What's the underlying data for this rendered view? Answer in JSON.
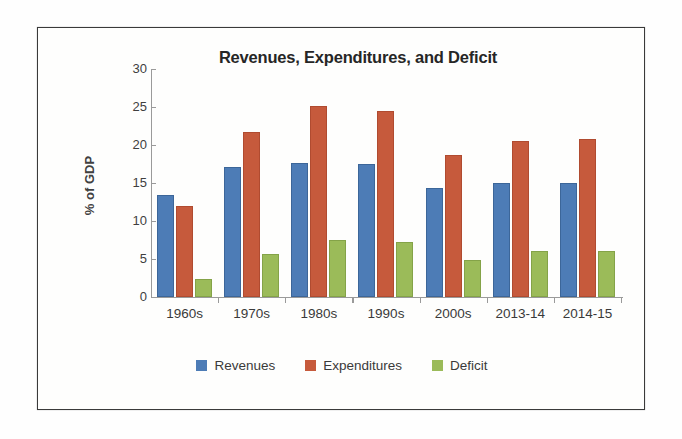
{
  "chart_data": {
    "type": "bar",
    "title": "Revenues, Expenditures, and Deficit",
    "xlabel": "",
    "ylabel": "% of GDP",
    "ylim": [
      0,
      30
    ],
    "yticks": [
      0,
      5,
      10,
      15,
      20,
      25,
      30
    ],
    "grid": false,
    "legend_position": "bottom",
    "categories": [
      "1960s",
      "1970s",
      "1980s",
      "1990s",
      "2000s",
      "2013-14",
      "2014-15"
    ],
    "series": [
      {
        "name": "Revenues",
        "color": "#4d7cb6",
        "values": [
          13.1,
          16.9,
          17.4,
          17.2,
          14.1,
          14.7,
          14.7
        ]
      },
      {
        "name": "Expenditures",
        "color": "#c65a3c",
        "values": [
          11.7,
          21.5,
          24.9,
          24.2,
          18.4,
          20.3,
          20.5
        ]
      },
      {
        "name": "Deficit",
        "color": "#9bbb59",
        "values": [
          2.1,
          5.4,
          7.3,
          7.0,
          4.6,
          5.8,
          5.8
        ]
      }
    ]
  }
}
